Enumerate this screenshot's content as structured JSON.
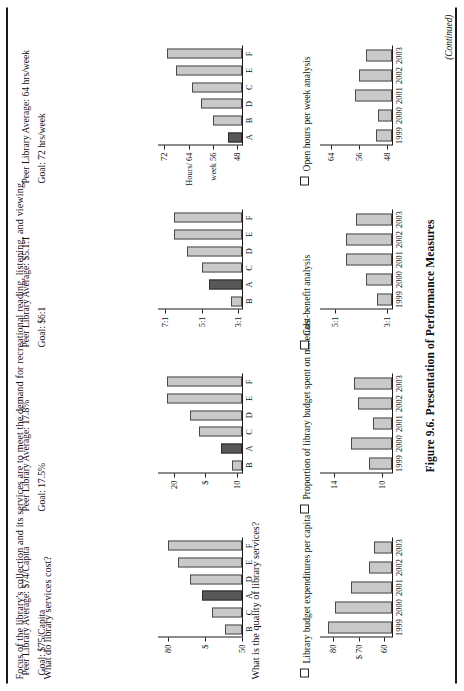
{
  "page": {
    "intro": "Focus of the library's collection and its services are to meet the demand for recreational reading, listening, and viewing.",
    "questions": [
      "What do library services cost?",
      "What is the quality of library services?"
    ],
    "figure_caption": "Figure 9.6. Presentation of Performance Measures",
    "continued": "(Continued)"
  },
  "chart_data": [
    {
      "type": "bar",
      "title": "Library budget expenditures per capita",
      "categories": [
        "1999",
        "2000",
        "2001",
        "2002",
        "2003"
      ],
      "values": [
        82,
        79,
        73,
        66,
        64
      ],
      "xlabel": "",
      "ylabel": "$",
      "ytick_labels": [
        "80",
        "$ 70",
        "60"
      ],
      "ytick_values": [
        80,
        70,
        60
      ],
      "ylim": [
        57,
        85
      ],
      "grid": false
    },
    {
      "type": "bar",
      "title": "Peer comparison: Library budget expenditures per capita",
      "categories": [
        "B",
        "C",
        "A",
        "D",
        "E",
        "F"
      ],
      "values": [
        57,
        62,
        66,
        71,
        76,
        80
      ],
      "highlight_category": "A",
      "xlabel": "",
      "ylabel": "$",
      "ytick_labels": [
        "80",
        "$",
        "50"
      ],
      "ytick_values": [
        80,
        65,
        50
      ],
      "ylim": [
        50,
        84
      ],
      "note_average": "Peer Library Average: $74/Capita",
      "note_goal": "Goal: $75/Capita",
      "grid": false
    },
    {
      "type": "bar",
      "title": "Proportion of library budget spent on materials",
      "categories": [
        "1999",
        "2000",
        "2001",
        "2002",
        "2003"
      ],
      "values": [
        11.1,
        12.6,
        10.8,
        12.0,
        12.4
      ],
      "xlabel": "",
      "ylabel": "",
      "ytick_labels": [
        "14",
        "10"
      ],
      "ytick_values": [
        14,
        10
      ],
      "ylim": [
        9.2,
        15.2
      ],
      "grid": false
    },
    {
      "type": "bar",
      "title": "Peer comparison: Proportion of library budget spent on materials",
      "categories": [
        "B",
        "A",
        "C",
        "D",
        "E",
        "F"
      ],
      "values": [
        10.8,
        12.6,
        16.0,
        17.5,
        21.0,
        21.0
      ],
      "highlight_category": "A",
      "xlabel": "",
      "ylabel": "$",
      "ytick_labels": [
        "20",
        "$",
        "10"
      ],
      "ytick_values": [
        20,
        15,
        10
      ],
      "ylim": [
        9.2,
        22.5
      ],
      "note_average": "Peer Library Average: 17.8%",
      "note_goal": "Goal: 17.5%",
      "grid": false
    },
    {
      "type": "bar",
      "title": "Cost-benefit analysis",
      "categories": [
        "1999",
        "2000",
        "2001",
        "2002",
        "2003"
      ],
      "values": [
        3.4,
        3.8,
        4.6,
        4.6,
        4.2
      ],
      "xlabel": "",
      "ylabel": "",
      "ytick_labels": [
        "5:1",
        "3:1"
      ],
      "ytick_values": [
        5,
        3
      ],
      "ylim": [
        2.8,
        5.6
      ],
      "grid": false
    },
    {
      "type": "bar",
      "title": "Peer comparison: Cost-benefit analysis",
      "categories": [
        "B",
        "A",
        "C",
        "D",
        "E",
        "F"
      ],
      "values": [
        3.4,
        4.6,
        5.0,
        5.8,
        6.5,
        6.5
      ],
      "highlight_category": "A",
      "xlabel": "",
      "ylabel": "Ratio",
      "ytick_labels": [
        "7:1",
        "5:1",
        "3:1"
      ],
      "ytick_values": [
        7,
        5,
        3
      ],
      "ylim": [
        2.8,
        7.4
      ],
      "note_average": "Peer Library Average: $5.1:1",
      "note_goal": "Goal: $6:1",
      "grid": false
    },
    {
      "type": "bar",
      "title": "Open hours per week analysis",
      "categories": [
        "1999",
        "2000",
        "2001",
        "2002",
        "2003"
      ],
      "values": [
        51,
        50.5,
        57,
        56,
        54
      ],
      "xlabel": "",
      "ylabel": "",
      "ytick_labels": [
        "64",
        "56",
        "48"
      ],
      "ytick_values": [
        64,
        56,
        48
      ],
      "ylim": [
        46.5,
        67
      ],
      "grid": false
    },
    {
      "type": "bar",
      "title": "Peer comparison: Open hours per week",
      "categories": [
        "A",
        "B",
        "D",
        "C",
        "E",
        "F"
      ],
      "values": [
        51,
        56,
        60,
        63,
        68,
        71
      ],
      "highlight_category": "A",
      "xlabel": "",
      "ylabel": "Hours/ week",
      "ytick_labels": [
        "72",
        "Hours/ 64",
        "week 56",
        "48"
      ],
      "ytick_values": [
        72,
        64,
        56,
        48
      ],
      "ylim": [
        46.5,
        74
      ],
      "note_average": "Peer Library Average: 64 hrs/week",
      "note_goal": "Goal: 72 hrs/week",
      "grid": false
    }
  ]
}
